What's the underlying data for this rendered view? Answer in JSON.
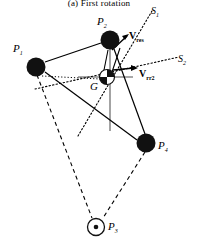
{
  "figure": {
    "caption": "(a) First rotation",
    "type": "mechanics-vector-diagram",
    "background": "#ffffff",
    "ink": "#000000",
    "gray_axis_color": "#8c8c8c"
  },
  "points": [
    {
      "id": "P1",
      "label": "P",
      "sub": "1",
      "x": 36,
      "y": 67,
      "r": 10,
      "style": "filled-black",
      "label_x": 13,
      "label_y": 44
    },
    {
      "id": "P2",
      "label": "P",
      "sub": "2",
      "x": 110,
      "y": 40,
      "r": 10,
      "style": "filled-black",
      "label_x": 99,
      "label_y": 17
    },
    {
      "id": "P4",
      "label": "P",
      "sub": "4",
      "x": 146,
      "y": 143,
      "r": 10,
      "style": "filled-black",
      "label_x": 159,
      "label_y": 142
    },
    {
      "id": "P3",
      "label": "P",
      "sub": "3",
      "x": 96,
      "y": 227,
      "r": 9,
      "style": "circle-dot",
      "label_x": 109,
      "label_y": 223
    },
    {
      "id": "G",
      "label": "G",
      "sub": "",
      "x": 107,
      "y": 77,
      "r": 8,
      "style": "quartered-circle",
      "label_x": 92,
      "label_y": 84
    }
  ],
  "axes": [
    {
      "id": "S1",
      "label": "S",
      "sub": "1",
      "style": "dotted",
      "x1": 78,
      "y1": 134,
      "x2": 151,
      "y2": 12,
      "label_x": 152,
      "label_y": 9
    },
    {
      "id": "S2",
      "label": "S",
      "sub": "2",
      "style": "dotted",
      "x1": 35,
      "y1": 88,
      "x2": 178,
      "y2": 58,
      "label_x": 179,
      "label_y": 57
    }
  ],
  "vectors": [
    {
      "id": "Vres",
      "label": "V",
      "sub": "res",
      "style": "arrow-solid",
      "x1": 113,
      "y1": 48,
      "x2": 128,
      "y2": 36,
      "label_x": 129,
      "label_y": 35
    },
    {
      "id": "Vrr2",
      "label": "V",
      "sub": "rr2",
      "style": "arrow-solid",
      "x1": 113,
      "y1": 71,
      "x2": 139,
      "y2": 69,
      "label_x": 139,
      "label_y": 72
    }
  ],
  "edges": {
    "solid": [
      {
        "from": "P1",
        "to": "P2"
      },
      {
        "from": "P1",
        "to": "P4"
      },
      {
        "from": "P2",
        "to": "P4"
      },
      {
        "from": "P1",
        "to": "G"
      }
    ],
    "dashed": [
      {
        "from": "P1",
        "to": "P3"
      },
      {
        "from": "P4",
        "to": "P3"
      }
    ],
    "dotted_internal": [
      {
        "from": "P1",
        "to": "G"
      }
    ]
  },
  "crosshair": {
    "horizontal": {
      "x1": 78,
      "y1": 77,
      "x2": 133,
      "y2": 77
    },
    "vertical": {
      "x1": 110,
      "y1": 40,
      "x2": 110,
      "y2": 130
    }
  }
}
